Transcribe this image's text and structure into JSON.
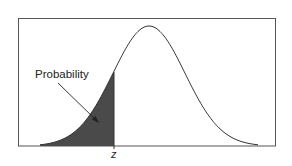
{
  "diagram": {
    "type": "normal-distribution-cdf",
    "annotation_label": "Probability",
    "z_label": "z",
    "colors": {
      "shaded_area": "#4a4a4a",
      "curve": "#333333",
      "frame": "#555555",
      "background": "#ffffff"
    }
  },
  "chart_data": {
    "type": "area",
    "title": "",
    "xlabel": "",
    "ylabel": "",
    "curve": "normal density",
    "shaded_region": "left tail up to z",
    "annotations": [
      "Probability",
      "z"
    ],
    "grid": false,
    "legend": "none"
  }
}
